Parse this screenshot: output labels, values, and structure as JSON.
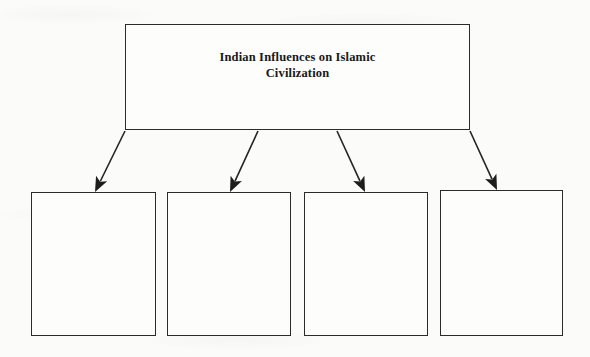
{
  "document": {
    "type": "flowchart-diagram",
    "background_color": "#fbfbfa",
    "line_color": "#242424",
    "text_color": "#181818"
  },
  "title_node": {
    "label": "Indian Influences on Islamic\nCivilization",
    "line_1": "Indian Influences on Islamic",
    "line_2": "Civilization",
    "x": 125,
    "y": 24,
    "width": 345,
    "height": 106
  },
  "child_nodes": [
    {
      "label": "",
      "x": 31,
      "y": 192,
      "width": 125,
      "height": 144
    },
    {
      "label": "",
      "x": 167,
      "y": 192,
      "width": 124,
      "height": 144
    },
    {
      "label": "",
      "x": 304,
      "y": 192,
      "width": 124,
      "height": 144
    },
    {
      "label": "",
      "x": 440,
      "y": 190,
      "width": 123,
      "height": 146
    }
  ],
  "connectors": [
    {
      "name": "arrow-title-to-box-1",
      "from_x": 125,
      "from_y": 131,
      "to_x": 95,
      "to_y": 192
    },
    {
      "name": "arrow-title-to-box-2",
      "from_x": 258,
      "from_y": 131,
      "to_x": 230,
      "to_y": 192
    },
    {
      "name": "arrow-title-to-box-3",
      "from_x": 337,
      "from_y": 131,
      "to_x": 365,
      "to_y": 192
    },
    {
      "name": "arrow-title-to-box-4",
      "from_x": 470,
      "from_y": 131,
      "to_x": 497,
      "to_y": 190
    }
  ]
}
